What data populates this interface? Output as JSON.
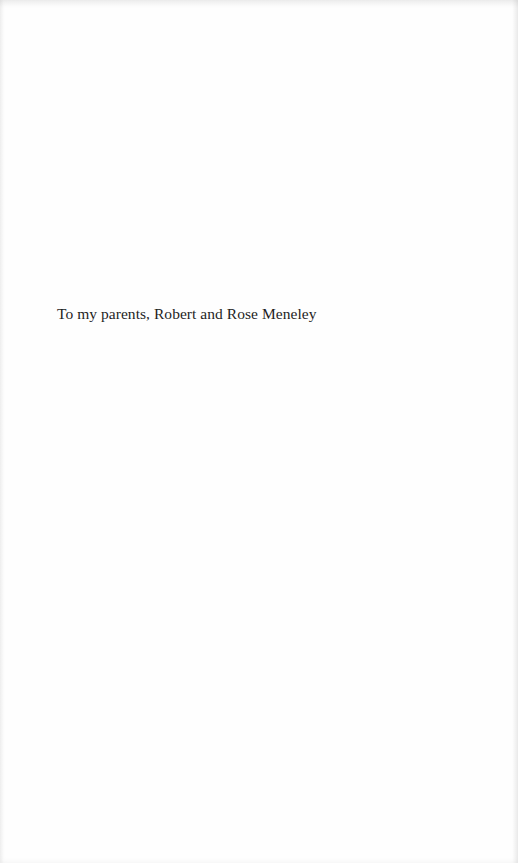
{
  "page": {
    "background": "#fefefe",
    "text_color": "#1e1e1e"
  },
  "dedication": {
    "text": "To my parents, Robert and Rose Meneley"
  }
}
